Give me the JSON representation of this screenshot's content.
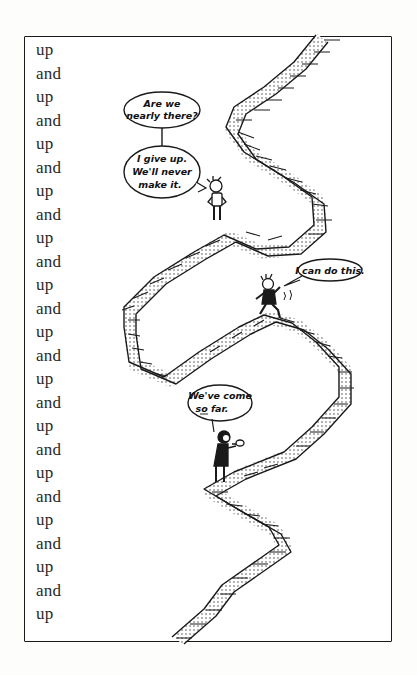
{
  "panel": {
    "description": "Single comic panel: a long zigzag staircase climbing to the top edge, with three figures at different stages of the climb.",
    "left_column": {
      "words": [
        "up",
        "and",
        "up",
        "and",
        "up",
        "and",
        "up",
        "and",
        "up",
        "and",
        "up",
        "and",
        "up",
        "and",
        "up",
        "and",
        "up",
        "and",
        "up",
        "and",
        "up",
        "and",
        "up",
        "and",
        "up"
      ]
    },
    "speech_bubbles": {
      "top_question": {
        "line1": "Are we",
        "line2": "nearly there?"
      },
      "give_up": {
        "line1": "I give up.",
        "line2": "We'll never",
        "line3": "make it."
      },
      "can_do": {
        "line1": "I can do this."
      },
      "come_far": {
        "line1": "We've come",
        "line2": "so far."
      }
    },
    "characters": [
      {
        "name": "standing-figure",
        "pose": "hands on hips, standing at top landing"
      },
      {
        "name": "running-figure",
        "pose": "running up the stairs"
      },
      {
        "name": "violin-figure",
        "pose": "playing violin on lower landing"
      }
    ],
    "colors": {
      "ink": "#1a1a1a",
      "paper": "#ffffff",
      "text": "#2a2a2a"
    }
  }
}
